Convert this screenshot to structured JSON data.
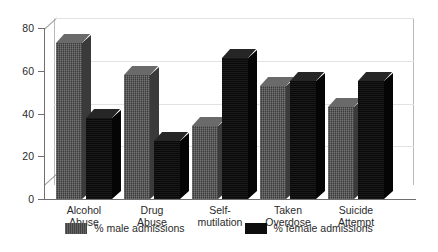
{
  "chart_data": {
    "type": "bar",
    "title": "",
    "xlabel": "",
    "ylabel": "",
    "ylim": [
      0,
      80
    ],
    "yticks": [
      0,
      20,
      40,
      60,
      80
    ],
    "grid": true,
    "legend_position": "bottom",
    "categories": [
      "Alcohol\nAbuse",
      "Drug\nAbuse",
      "Self-\nmutilation",
      "Taken\nOverdose",
      "Suicide\nAttempt"
    ],
    "series": [
      {
        "name": "% male admissions",
        "color": "#4a4a4a",
        "values": [
          73,
          58,
          34,
          53,
          43
        ]
      },
      {
        "name": "% female admissions",
        "color": "#0d0d0d",
        "values": [
          38,
          27,
          66,
          55,
          55
        ]
      }
    ]
  },
  "axis": {
    "tick_labels": [
      "0",
      "20",
      "40",
      "60",
      "80"
    ]
  },
  "legend": {
    "items": [
      {
        "label": "% male admissions",
        "swatch": "grey-swatch-icon"
      },
      {
        "label": "% female admissions",
        "swatch": "black-swatch-icon"
      }
    ]
  }
}
